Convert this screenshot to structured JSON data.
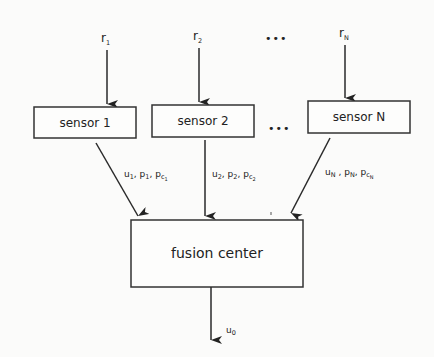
{
  "inputs": [
    {
      "base": "r",
      "sub": "1"
    },
    {
      "base": "r",
      "sub": "2"
    },
    {
      "base": "r",
      "sub": "N"
    }
  ],
  "ellipsis": "•••",
  "sensors": [
    {
      "label": "sensor 1"
    },
    {
      "label": "sensor 2"
    },
    {
      "label": "sensor N"
    }
  ],
  "links": [
    {
      "u": "u",
      "u_sub": "1",
      "p": "p",
      "p_sub": "1",
      "pc": "p",
      "pc_sub": "c",
      "pc_subsub": "1"
    },
    {
      "u": "u",
      "u_sub": "2",
      "p": "p",
      "p_sub": "2",
      "pc": "p",
      "pc_sub": "c",
      "pc_subsub": "2"
    },
    {
      "u": "u",
      "u_sub": "N",
      "p": "p",
      "p_sub": "N",
      "pc": "p",
      "pc_sub": "c",
      "pc_subsub": "N"
    }
  ],
  "fusion": {
    "label": "fusion center"
  },
  "output": {
    "base": "u",
    "sub": "0"
  }
}
